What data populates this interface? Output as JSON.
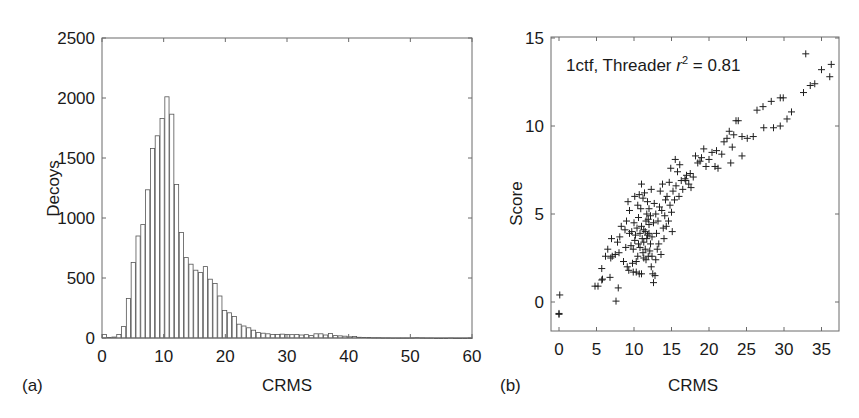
{
  "figure": {
    "panel_a_label": "(a)",
    "panel_b_label": "(b)"
  },
  "chart_data": [
    {
      "type": "bar",
      "title": "",
      "xlabel": "CRMS",
      "ylabel": "Decoys",
      "xlim": [
        0,
        60
      ],
      "ylim": [
        0,
        2500
      ],
      "xticks": [
        "0",
        "10",
        "20",
        "30",
        "40",
        "50",
        "60"
      ],
      "yticks": [
        "0",
        "500",
        "1000",
        "1500",
        "2000",
        "2500"
      ],
      "grid": false,
      "bin_width": 0.78,
      "bar_fill": "#ffffff",
      "bar_edge": "#555555",
      "values": [
        30,
        5,
        8,
        30,
        95,
        330,
        630,
        850,
        945,
        1235,
        1580,
        1685,
        1830,
        2010,
        1865,
        1280,
        880,
        670,
        615,
        565,
        545,
        595,
        490,
        455,
        350,
        230,
        210,
        180,
        115,
        100,
        85,
        65,
        45,
        40,
        35,
        30,
        30,
        32,
        30,
        28,
        30,
        25,
        28,
        20,
        35,
        35,
        25,
        38,
        20,
        18,
        15,
        10,
        12,
        6,
        5,
        4,
        3,
        3,
        2,
        2,
        1,
        1,
        1,
        1,
        2,
        3,
        2,
        1,
        1,
        0,
        0,
        0,
        1,
        0,
        0,
        0,
        0
      ]
    },
    {
      "type": "scatter",
      "title": "",
      "annotation": {
        "prefix": "1ctf, Threader ",
        "r": "r",
        "sup": "2",
        "suffix": " = 0.81"
      },
      "xlabel": "CRMS",
      "ylabel": "Score",
      "xlim": [
        -1,
        37
      ],
      "ylim": [
        -1.65,
        15
      ],
      "xticks": [
        "0",
        "5",
        "10",
        "15",
        "20",
        "25",
        "30",
        "35"
      ],
      "yticks": [
        "0",
        "5",
        "10",
        "15"
      ],
      "grid": false,
      "marker": "+",
      "points": [
        [
          0.1,
          0.4
        ],
        [
          0.0,
          -0.7
        ],
        [
          0.0,
          -0.65
        ],
        [
          4.8,
          0.9
        ],
        [
          5.2,
          0.9
        ],
        [
          5.7,
          1.25
        ],
        [
          5.8,
          1.3
        ],
        [
          6.8,
          1.4
        ],
        [
          7.9,
          0.8
        ],
        [
          7.6,
          0.05
        ],
        [
          5.7,
          1.9
        ],
        [
          6.2,
          2.6
        ],
        [
          6.9,
          2.5
        ],
        [
          7.1,
          2.6
        ],
        [
          7.5,
          2.7
        ],
        [
          8.0,
          2.8
        ],
        [
          6.5,
          3.0
        ],
        [
          7.0,
          3.6
        ],
        [
          7.8,
          3.4
        ],
        [
          8.1,
          3.7
        ],
        [
          8.3,
          4.3
        ],
        [
          8.9,
          3.1
        ],
        [
          9.0,
          4.6
        ],
        [
          9.2,
          5.7
        ],
        [
          9.4,
          5.2
        ],
        [
          9.6,
          3.2
        ],
        [
          9.8,
          2.2
        ],
        [
          9.9,
          1.7
        ],
        [
          10.3,
          1.7
        ],
        [
          10.7,
          1.6
        ],
        [
          11.0,
          1.6
        ],
        [
          10.5,
          2.6
        ],
        [
          10.8,
          3.1
        ],
        [
          11.1,
          3.6
        ],
        [
          11.3,
          4.1
        ],
        [
          11.5,
          3.0
        ],
        [
          11.6,
          2.4
        ],
        [
          11.8,
          3.8
        ],
        [
          12.0,
          4.4
        ],
        [
          12.2,
          3.3
        ],
        [
          10.2,
          3.8
        ],
        [
          10.4,
          4.2
        ],
        [
          10.6,
          4.8
        ],
        [
          10.9,
          5.3
        ],
        [
          11.2,
          5.9
        ],
        [
          11.4,
          6.2
        ],
        [
          11.7,
          5.0
        ],
        [
          11.9,
          4.7
        ],
        [
          12.1,
          2.9
        ],
        [
          12.3,
          2.0
        ],
        [
          12.5,
          1.6
        ],
        [
          12.6,
          1.1
        ],
        [
          12.8,
          1.5
        ],
        [
          12.9,
          2.4
        ],
        [
          13.1,
          3.0
        ],
        [
          9.7,
          4.0
        ],
        [
          10.0,
          4.5
        ],
        [
          10.1,
          3.5
        ],
        [
          10.6,
          3.3
        ],
        [
          10.8,
          3.9
        ],
        [
          11.0,
          4.3
        ],
        [
          11.2,
          2.8
        ],
        [
          11.3,
          3.4
        ],
        [
          11.5,
          4.0
        ],
        [
          11.7,
          3.6
        ],
        [
          11.9,
          2.6
        ],
        [
          12.0,
          3.9
        ],
        [
          12.2,
          4.9
        ],
        [
          12.4,
          3.7
        ],
        [
          12.6,
          4.5
        ],
        [
          12.7,
          5.6
        ],
        [
          12.9,
          5.0
        ],
        [
          13.0,
          3.9
        ],
        [
          13.2,
          4.6
        ],
        [
          13.4,
          5.4
        ],
        [
          13.5,
          6.3
        ],
        [
          13.7,
          5.2
        ],
        [
          13.9,
          4.2
        ],
        [
          14.1,
          4.9
        ],
        [
          14.2,
          5.8
        ],
        [
          14.4,
          6.0
        ],
        [
          14.6,
          4.6
        ],
        [
          14.8,
          5.5
        ],
        [
          15.0,
          5.1
        ],
        [
          15.2,
          6.3
        ],
        [
          15.4,
          5.8
        ],
        [
          15.6,
          6.6
        ],
        [
          15.8,
          7.4
        ],
        [
          15.5,
          8.1
        ],
        [
          16.0,
          6.0
        ],
        [
          16.3,
          6.9
        ],
        [
          16.5,
          6.4
        ],
        [
          16.8,
          7.0
        ],
        [
          17.0,
          7.2
        ],
        [
          17.3,
          6.7
        ],
        [
          17.6,
          6.5
        ],
        [
          17.9,
          7.1
        ],
        [
          18.2,
          8.3
        ],
        [
          18.5,
          7.9
        ],
        [
          16.1,
          7.8
        ],
        [
          16.9,
          6.9
        ],
        [
          17.5,
          7.3
        ],
        [
          18.8,
          8.0
        ],
        [
          19.0,
          8.2
        ],
        [
          19.3,
          8.7
        ],
        [
          19.6,
          7.7
        ],
        [
          20.0,
          8.1
        ],
        [
          20.4,
          8.5
        ],
        [
          20.8,
          7.7
        ],
        [
          21.0,
          8.6
        ],
        [
          21.2,
          7.6
        ],
        [
          21.7,
          8.4
        ],
        [
          22.0,
          9.1
        ],
        [
          22.4,
          9.3
        ],
        [
          22.7,
          9.7
        ],
        [
          23.1,
          8.8
        ],
        [
          23.6,
          10.3
        ],
        [
          23.9,
          10.3
        ],
        [
          24.4,
          9.4
        ],
        [
          25.1,
          9.3
        ],
        [
          25.9,
          9.4
        ],
        [
          24.4,
          8.3
        ],
        [
          22.9,
          7.9
        ],
        [
          23.3,
          9.5
        ],
        [
          26.4,
          10.9
        ],
        [
          27.2,
          11.1
        ],
        [
          28.3,
          11.4
        ],
        [
          29.5,
          11.6
        ],
        [
          29.9,
          11.6
        ],
        [
          27.3,
          9.9
        ],
        [
          28.6,
          9.9
        ],
        [
          29.5,
          10.0
        ],
        [
          30.4,
          10.4
        ],
        [
          31.0,
          10.8
        ],
        [
          32.6,
          11.9
        ],
        [
          33.5,
          12.3
        ],
        [
          34.1,
          12.4
        ],
        [
          35.0,
          13.2
        ],
        [
          36.3,
          13.5
        ],
        [
          36.1,
          12.8
        ],
        [
          32.9,
          14.1
        ],
        [
          9.4,
          3.9
        ],
        [
          9.9,
          3.0
        ],
        [
          10.3,
          2.3
        ],
        [
          10.5,
          5.5
        ],
        [
          11.0,
          6.7
        ],
        [
          11.3,
          2.5
        ],
        [
          11.6,
          4.6
        ],
        [
          12.0,
          5.3
        ],
        [
          12.4,
          2.6
        ],
        [
          13.3,
          3.3
        ],
        [
          13.6,
          2.7
        ],
        [
          14.0,
          3.6
        ],
        [
          14.3,
          4.3
        ],
        [
          14.7,
          6.8
        ],
        [
          15.1,
          4.0
        ],
        [
          8.6,
          2.3
        ],
        [
          9.1,
          2.0
        ],
        [
          9.3,
          1.8
        ],
        [
          8.8,
          4.1
        ],
        [
          10.1,
          6.0
        ],
        [
          10.7,
          6.1
        ],
        [
          11.8,
          5.7
        ],
        [
          12.3,
          6.4
        ],
        [
          13.8,
          6.7
        ],
        [
          14.9,
          7.6
        ]
      ]
    }
  ]
}
